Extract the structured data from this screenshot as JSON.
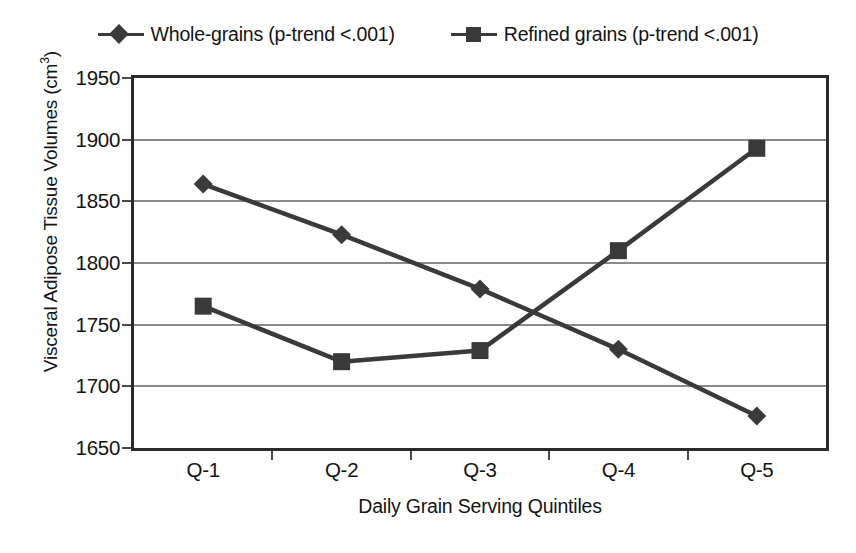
{
  "chart_data": {
    "type": "line",
    "title": "",
    "categories": [
      "Q-1",
      "Q-2",
      "Q-3",
      "Q-4",
      "Q-5"
    ],
    "series": [
      {
        "name": "Whole-grains (p-trend <.001)",
        "marker": "diamond",
        "color": "#3a3a3a",
        "values": [
          1864,
          1823,
          1779,
          1730,
          1676
        ]
      },
      {
        "name": "Refined grains (p-trend <.001)",
        "marker": "square",
        "color": "#3a3a3a",
        "values": [
          1765,
          1720,
          1729,
          1810,
          1893
        ]
      }
    ],
    "xlabel": "Daily Grain Serving Quintiles",
    "ylabel": "Visceral Adipose Tissue Volumes (cm3)",
    "ylabel_base": "Visceral Adipose Tissue Volumes (cm",
    "ylabel_sup": "3",
    "ylabel_tail": ")",
    "ylim": [
      1650,
      1950
    ],
    "yticks": [
      1950,
      1900,
      1850,
      1800,
      1750,
      1700,
      1650
    ],
    "ytick_labels": [
      "1950",
      "1900",
      "1850",
      "1800",
      "1750",
      "1700",
      "1650"
    ],
    "grid": true,
    "grid_axis": "y",
    "legend_position": "top-center"
  },
  "legend": {
    "entries": [
      {
        "label": "Whole-grains (p-trend <.001)",
        "marker": "diamond"
      },
      {
        "label": "Refined grains (p-trend <.001)",
        "marker": "square"
      }
    ]
  },
  "axes": {
    "x_title": "Daily Grain Serving Quintiles",
    "y_title_base": "Visceral Adipose Tissue Volumes (cm",
    "y_title_sup": "3",
    "y_title_tail": ")"
  },
  "colors": {
    "series_ink": "#3a3a3a",
    "frame": "#2b2b2b",
    "gridline": "#8a8a8a",
    "text": "#141414",
    "background": "#ffffff"
  }
}
